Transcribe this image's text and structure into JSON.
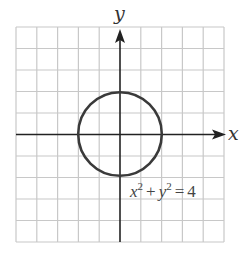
{
  "graph": {
    "x_axis_label": "x",
    "y_axis_label": "y",
    "equation": {
      "x_var": "x",
      "x_exp": "2",
      "plus": "+",
      "y_var": "y",
      "y_exp": "2",
      "equals": "=",
      "rhs": "4"
    },
    "grid": {
      "columns": 10,
      "rows": 10,
      "x_range": [
        -5,
        5
      ],
      "y_range": [
        -5,
        5
      ]
    },
    "circle": {
      "center": [
        0,
        0
      ],
      "radius": 2
    },
    "colors": {
      "grid": "#c8c8c8",
      "axes": "#222222",
      "curve": "#3a3a3a",
      "text": "#444444"
    }
  }
}
